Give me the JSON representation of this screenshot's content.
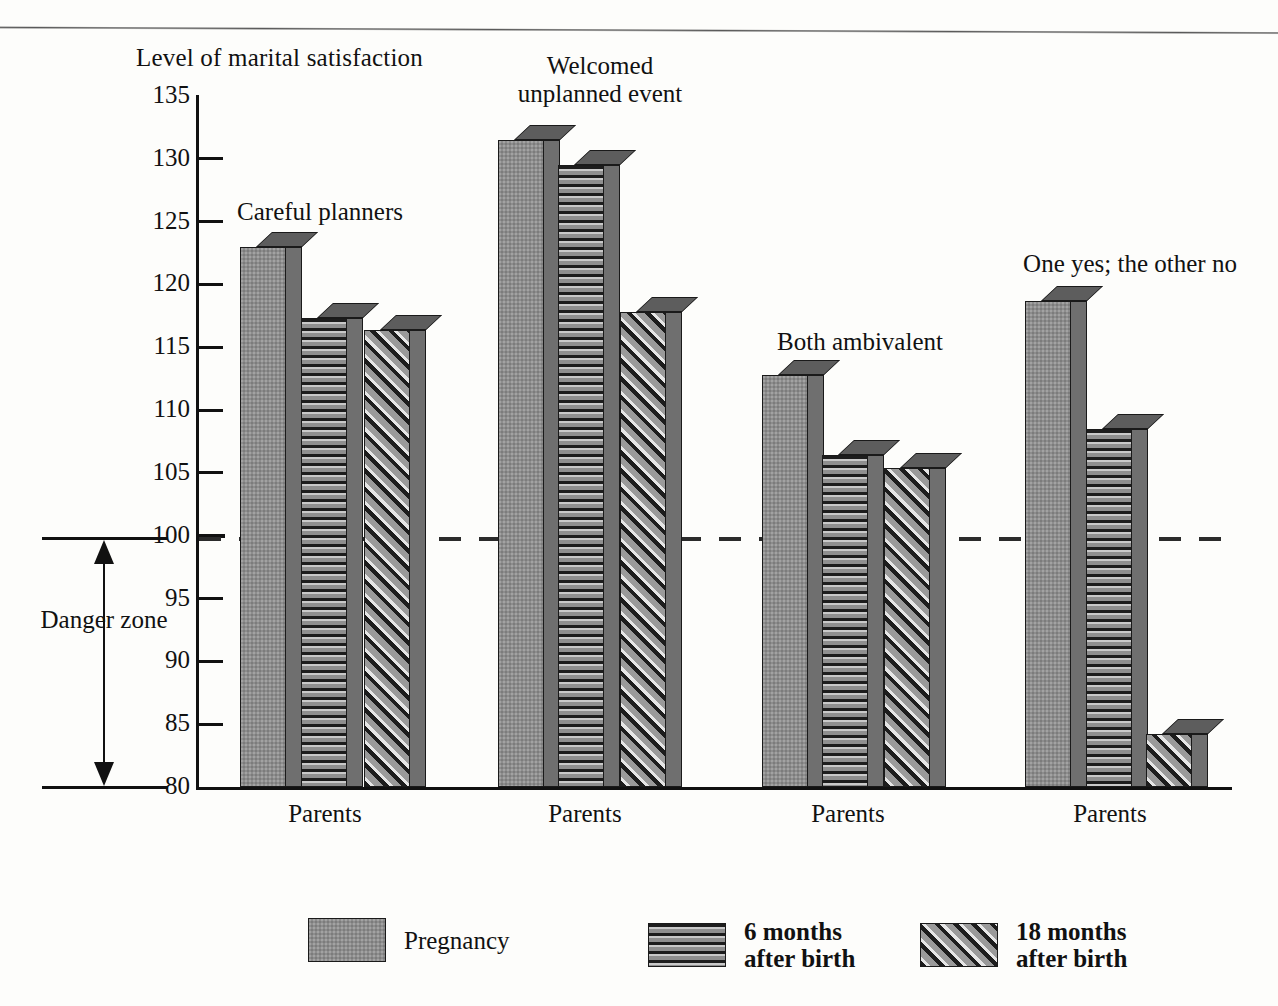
{
  "chart_data": {
    "type": "bar",
    "title": "",
    "ylabel": "Level of marital satisfaction",
    "xlabel": "",
    "ylim": [
      80,
      135
    ],
    "yticks": [
      135,
      130,
      125,
      120,
      115,
      110,
      105,
      100,
      95,
      90,
      85,
      80
    ],
    "grid": false,
    "legend_position": "bottom",
    "reference_line": {
      "value": 100,
      "style": "dashed"
    },
    "annotations": [
      {
        "text": "Danger zone",
        "note": "double-headed arrow spanning 80 to 100 at left of axis"
      }
    ],
    "categories": [
      "Careful planners",
      "Welcomed unplanned event",
      "Both ambivalent",
      "One yes; the other no"
    ],
    "category_axis_labels": [
      "Parents",
      "Parents",
      "Parents",
      "Parents"
    ],
    "series": [
      {
        "name": "Pregnancy",
        "pattern": "solid-stipple",
        "values": [
          123,
          131.5,
          112.8,
          118.7
        ]
      },
      {
        "name": "6 months after birth",
        "pattern": "horizontal-lines",
        "values": [
          117.3,
          129.5,
          106.4,
          108.5
        ]
      },
      {
        "name": "18 months after birth",
        "pattern": "diagonal-hatch",
        "values": [
          116.4,
          117.8,
          105.4,
          84.2
        ]
      }
    ]
  },
  "axis": {
    "title": "Level of marital satisfaction",
    "ticks": [
      "135",
      "130",
      "125",
      "120",
      "115",
      "110",
      "105",
      "100",
      "95",
      "90",
      "85",
      "80"
    ]
  },
  "danger_zone": {
    "label": "Danger\nzone",
    "top_value": "100",
    "bottom_value": "80"
  },
  "groups": [
    {
      "caption": "Careful planners",
      "x_label": "Parents"
    },
    {
      "caption": "Welcomed\nunplanned event",
      "x_label": "Parents"
    },
    {
      "caption": "Both ambivalent",
      "x_label": "Parents"
    },
    {
      "caption": "One yes; the other no",
      "x_label": "Parents"
    }
  ],
  "legend": {
    "items": [
      {
        "label": "Pregnancy",
        "pattern": "solid-stipple"
      },
      {
        "label": "6 months\nafter birth",
        "pattern": "horizontal-lines"
      },
      {
        "label": "18 months\nafter birth",
        "pattern": "diagonal-hatch"
      }
    ]
  },
  "colors": {
    "ink": "#111111",
    "bar_solid": "#8d8d8d",
    "bar_side": "#6f6f6f",
    "bar_top": "#5d5d5d",
    "paper": "#fdfdfb"
  }
}
